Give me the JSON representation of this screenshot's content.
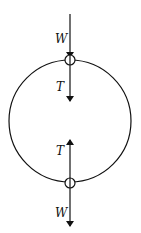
{
  "diagram": {
    "type": "free-body diagram",
    "loop": {
      "cx": 70,
      "cy": 121,
      "r": 61
    },
    "top_point": {
      "labels": {
        "weight": "W",
        "tension": "T"
      },
      "weight_direction": "down",
      "tension_direction": "down (toward center)"
    },
    "bottom_point": {
      "labels": {
        "weight": "W",
        "tension": "T"
      },
      "weight_direction": "down",
      "tension_direction": "up (toward center)"
    },
    "colors": {
      "line": "#111111",
      "background": "#ffffff"
    }
  }
}
